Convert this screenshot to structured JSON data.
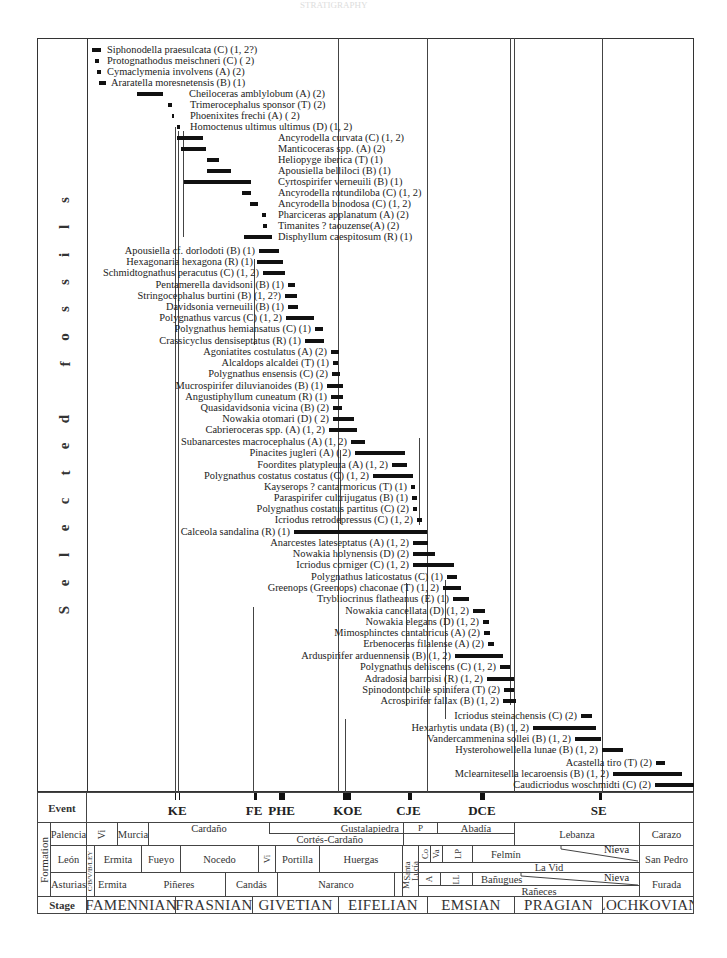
{
  "header": {
    "faint_title": "STRATIGRAPHY"
  },
  "vertical_title": [
    "S",
    "e",
    "l",
    "e",
    "c",
    "t",
    "e",
    "d",
    "",
    "f",
    "o",
    "s",
    "s",
    "i",
    "l",
    "s"
  ],
  "layout": {
    "stage_boundaries_px": {
      "start": 87,
      "FAMENNIAN_FRASNIAN": 175,
      "FRASNIAN_GIVETIAN": 252,
      "GIVETIAN_EIFELIAN": 338,
      "EIFELIAN_EMSIAN": 427,
      "EMSIAN_PRAGIAN": 514,
      "PRAGIAN_LOCHKOVIAN": 602,
      "end": 694
    }
  },
  "fossils": [
    {
      "name": "Siphonodella praesulcata (C) (1, 2?)",
      "y": 50,
      "x1": 92,
      "x2": 101,
      "label_x": 107,
      "align": "left"
    },
    {
      "name": "Protognathodus meischneri (C) ( 2)",
      "y": 61,
      "x1": 95,
      "x2": 99,
      "label_x": 107,
      "align": "left"
    },
    {
      "name": "Cymaclymenia involvens (A) (2)",
      "y": 72,
      "x1": 97,
      "x2": 101,
      "label_x": 107,
      "align": "left"
    },
    {
      "name": "Araratella moresnetensis (B) (1)",
      "y": 83,
      "x1": 99,
      "x2": 106,
      "label_x": 111,
      "align": "left"
    },
    {
      "name": "Cheiloceras amblylobum (A) (2)",
      "y": 94,
      "x1": 137,
      "x2": 163,
      "label_x": 189,
      "align": "left"
    },
    {
      "name": "Trimerocephalus sponsor (T) (2)",
      "y": 105,
      "x1": 168,
      "x2": 172,
      "label_x": 190,
      "align": "left"
    },
    {
      "name": "Phoenixites frechi (A) ( 2)",
      "y": 116,
      "x1": 172,
      "x2": 174,
      "label_x": 190,
      "align": "left"
    },
    {
      "name": "Homoctenus ultimus ultimus (D) (1, 2)",
      "y": 127,
      "x1": 177,
      "x2": 180,
      "label_x": 190,
      "align": "left"
    },
    {
      "name": "Ancyrodella curvata (C) (1, 2)",
      "y": 138,
      "x1": 177,
      "x2": 203,
      "label_x": 278,
      "align": "left"
    },
    {
      "name": "Manticoceras spp. (A) (2)",
      "y": 149,
      "x1": 181,
      "x2": 206,
      "label_x": 278,
      "align": "left"
    },
    {
      "name": "Heliopyge iberica (T) (1)",
      "y": 160,
      "x1": 207,
      "x2": 219,
      "label_x": 278,
      "align": "left"
    },
    {
      "name": "Apousiella belliloci (B) (1)",
      "y": 171,
      "x1": 207,
      "x2": 231,
      "label_x": 278,
      "align": "left"
    },
    {
      "name": "Cyrtospirifer verneuili (B) (1)",
      "y": 182,
      "x1": 184,
      "x2": 251,
      "label_x": 278,
      "align": "left"
    },
    {
      "name": "Ancyrodella rotundiloba (C) (1, 2)",
      "y": 193,
      "x1": 242,
      "x2": 251,
      "label_x": 278,
      "align": "left"
    },
    {
      "name": "Ancyrodella binodosa (C) (1, 2)",
      "y": 204,
      "x1": 250,
      "x2": 258,
      "label_x": 278,
      "align": "left"
    },
    {
      "name": "Pharciceras applanatum (A) (2)",
      "y": 215,
      "x1": 262,
      "x2": 266,
      "label_x": 278,
      "align": "left"
    },
    {
      "name": "Timanites ? taouzense(A) (2)",
      "y": 226,
      "x1": 263,
      "x2": 267,
      "label_x": 278,
      "align": "left"
    },
    {
      "name": "Disphyllum caespitosum (R) (1)",
      "y": 237,
      "x1": 244,
      "x2": 272,
      "label_x": 278,
      "align": "left"
    },
    {
      "name": "Apousiella cf. dorlodoti (B) (1)",
      "y": 251,
      "x1": 259,
      "x2": 279,
      "label_x": 253,
      "align": "right"
    },
    {
      "name": "Hexagonaria hexagona (R) (1)",
      "y": 262,
      "x1": 257,
      "x2": 283,
      "label_x": 253,
      "align": "right"
    },
    {
      "name": "Schmidtognathus peracutus (C) (1, 2)",
      "y": 273,
      "x1": 263,
      "x2": 285,
      "label_x": 253,
      "align": "right"
    },
    {
      "name": "Pentamerella davidsoni (B) (1)",
      "y": 285,
      "x1": 288,
      "x2": 295,
      "label_x": 253,
      "align": "right"
    },
    {
      "name": "Stringocephalus burtini (B) (1, 2?)",
      "y": 296,
      "x1": 285,
      "x2": 297,
      "label_x": 253,
      "align": "right"
    },
    {
      "name": "Davidsonia verneuili (B) (1)",
      "y": 307,
      "x1": 288,
      "x2": 298,
      "label_x": 253,
      "align": "right"
    },
    {
      "name": "Polygnathus varcus (C) (1, 2)",
      "y": 318,
      "x1": 286,
      "x2": 314,
      "label_x": 253,
      "align": "right"
    },
    {
      "name": "Polygnathus hemiansatus (C) (1)",
      "y": 329,
      "x1": 315,
      "x2": 323,
      "label_x": 253,
      "align": "right"
    },
    {
      "name": "Crassicyclus densiseptatus (R) (1)",
      "y": 341,
      "x1": 305,
      "x2": 324,
      "label_x": 253,
      "align": "right"
    },
    {
      "name": "Agoniatites costulatus (A) (2)",
      "y": 352,
      "x1": 331,
      "x2": 339,
      "label_x": 317,
      "align": "right"
    },
    {
      "name": "Alcaldops alcaldei (T) (1)",
      "y": 363,
      "x1": 333,
      "x2": 338,
      "label_x": 317,
      "align": "right"
    },
    {
      "name": "Polygnathus ensensis (C) (2)",
      "y": 374,
      "x1": 332,
      "x2": 340,
      "label_x": 317,
      "align": "right"
    },
    {
      "name": "Mucrospirifer diluvianoides (B) (1)",
      "y": 386,
      "x1": 327,
      "x2": 343,
      "label_x": 317,
      "align": "right"
    },
    {
      "name": "Angustiphyllum cuneatum (R) (1)",
      "y": 397,
      "x1": 331,
      "x2": 343,
      "label_x": 317,
      "align": "right"
    },
    {
      "name": "Quasidavidsonia vicina (B) (2)",
      "y": 408,
      "x1": 333,
      "x2": 342,
      "label_x": 317,
      "align": "right"
    },
    {
      "name": "Nowakia otomari (D) ( 2)",
      "y": 419,
      "x1": 333,
      "x2": 354,
      "label_x": 317,
      "align": "right"
    },
    {
      "name": "Cabrieroceras spp.  (A) (1, 2)",
      "y": 430,
      "x1": 329,
      "x2": 357,
      "label_x": 317,
      "align": "right"
    },
    {
      "name": "Subanarcestes macrocephalus (A) (1, 2)",
      "y": 442,
      "x1": 351,
      "x2": 365,
      "label_x": 317,
      "align": "right"
    },
    {
      "name": "Pinacites jugleri (A) ( 2)",
      "y": 453,
      "x1": 355,
      "x2": 405,
      "label_x": 317,
      "align": "right"
    },
    {
      "name": "Foordites platypleura (A) (1, 2)",
      "y": 465,
      "x1": 392,
      "x2": 407,
      "label_x": 317,
      "align": "right"
    },
    {
      "name": "Polygnathus costatus costatus (C) (1, 2)",
      "y": 476,
      "x1": 373,
      "x2": 413,
      "label_x": 317,
      "align": "right"
    },
    {
      "name": "Kayserops ? cantarmoricus (T) (1)",
      "y": 487,
      "x1": 411,
      "x2": 415,
      "label_x": 317,
      "align": "right"
    },
    {
      "name": "Paraspirifer cultrijugatus (B) (1)",
      "y": 498,
      "x1": 412,
      "x2": 417,
      "label_x": 317,
      "align": "right"
    },
    {
      "name": "Polygnathus costatus partitus (C) (2)",
      "y": 509,
      "x1": 413,
      "x2": 417,
      "label_x": 317,
      "align": "right"
    },
    {
      "name": "Icriodus retrodepressus (C) (1, 2)",
      "y": 520,
      "x1": 417,
      "x2": 422,
      "label_x": 317,
      "align": "right"
    },
    {
      "name": "Calceola sandalina (R) (1)",
      "y": 532,
      "x1": 294,
      "x2": 427,
      "label_x": 292,
      "align": "right"
    },
    {
      "name": "Anarcestes lateseptatus (A) (1, 2)",
      "y": 543,
      "x1": 413,
      "x2": 428,
      "label_x": 409,
      "align": "right"
    },
    {
      "name": "Nowakia holynensis (D) (2)",
      "y": 554,
      "x1": 413,
      "x2": 435,
      "label_x": 409,
      "align": "right"
    },
    {
      "name": "Icriodus corniger (C) (1, 2)",
      "y": 565,
      "x1": 413,
      "x2": 454,
      "label_x": 409,
      "align": "right"
    },
    {
      "name": "Polygnathus laticostatus (C) (1)",
      "y": 577,
      "x1": 447,
      "x2": 457,
      "label_x": 409,
      "align": "right"
    },
    {
      "name": "Greenops (Greenops) chaconae (T) (1, 2)",
      "y": 588,
      "x1": 443,
      "x2": 461,
      "label_x": 409,
      "align": "right"
    },
    {
      "name": "Trybliocrinus flatheanus (E) (1)",
      "y": 599,
      "x1": 453,
      "x2": 469,
      "label_x": 409,
      "align": "right"
    },
    {
      "name": "Nowakia cancellata (D) (1, 2)",
      "y": 611,
      "x1": 473,
      "x2": 485,
      "label_x": 409,
      "align": "right"
    },
    {
      "name": "Nowakia elegans (D) (1, 2)",
      "y": 622,
      "x1": 483,
      "x2": 489,
      "label_x": 409,
      "align": "right"
    },
    {
      "name": "Mimosphinctes cantabricus (A) (2)",
      "y": 633,
      "x1": 484,
      "x2": 490,
      "label_x": 409,
      "align": "right"
    },
    {
      "name": "Erbenoceras filalense (A) (2)",
      "y": 644,
      "x1": 488,
      "x2": 494,
      "label_x": 409,
      "align": "right"
    },
    {
      "name": "Arduspirifer arduennensis (B) (1, 2)",
      "y": 656,
      "x1": 455,
      "x2": 503,
      "label_x": 409,
      "align": "right"
    },
    {
      "name": "Polygnathus dehiscens (C) (1, 2)",
      "y": 667,
      "x1": 500,
      "x2": 510,
      "label_x": 409,
      "align": "right"
    },
    {
      "name": "Adradosia barroisi (R) (1, 2)",
      "y": 679,
      "x1": 487,
      "x2": 514,
      "label_x": 409,
      "align": "right"
    },
    {
      "name": "Spinodontochile spinifera (T) (2)",
      "y": 690,
      "x1": 504,
      "x2": 514,
      "label_x": 409,
      "align": "right"
    },
    {
      "name": "Acrospirifer fallax (B) (1, 2)",
      "y": 701,
      "x1": 503,
      "x2": 516,
      "label_x": 409,
      "align": "right"
    },
    {
      "name": "Icriodus steinachensis (C) (2)",
      "y": 716,
      "x1": 581,
      "x2": 592,
      "label_x": 524,
      "align": "right"
    },
    {
      "name": "Hexarhytis undata (B) (1, 2)",
      "y": 728,
      "x1": 533,
      "x2": 596,
      "label_x": 527,
      "align": "right"
    },
    {
      "name": "Vandercammenina sollei (B) (1, 2)",
      "y": 739,
      "x1": 575,
      "x2": 601,
      "label_x": 566,
      "align": "right"
    },
    {
      "name": "Hysterohowellella lunae (B) (1, 2)",
      "y": 750,
      "x1": 602,
      "x2": 623,
      "label_x": 566,
      "align": "right"
    },
    {
      "name": "Acastella tiro (T) (2)",
      "y": 763,
      "x1": 656,
      "x2": 665,
      "label_x": 566,
      "align": "right"
    },
    {
      "name": "Mclearnitesella lecaroensis (B) (1, 2)",
      "y": 774,
      "x1": 613,
      "x2": 682,
      "label_x": 566,
      "align": "right"
    },
    {
      "name": "Caudicriodus woschmidti (C) (2)",
      "y": 785,
      "x1": 655,
      "x2": 694,
      "label_x": 566,
      "align": "right"
    }
  ],
  "range_lines": [
    {
      "x": 175,
      "y1": 127,
      "y2": 792
    },
    {
      "x": 178,
      "y1": 131,
      "y2": 792
    },
    {
      "x": 183,
      "y1": 131,
      "y2": 237
    },
    {
      "x": 254,
      "y1": 259,
      "y2": 345
    },
    {
      "x": 253,
      "y1": 607,
      "y2": 792
    },
    {
      "x": 338,
      "y1": 38,
      "y2": 792
    },
    {
      "x": 340,
      "y1": 450,
      "y2": 524
    },
    {
      "x": 406,
      "y1": 583,
      "y2": 705
    },
    {
      "x": 419,
      "y1": 438,
      "y2": 525
    },
    {
      "x": 427,
      "y1": 38,
      "y2": 792
    },
    {
      "x": 514,
      "y1": 38,
      "y2": 792
    },
    {
      "x": 602,
      "y1": 38,
      "y2": 792
    },
    {
      "x": 345,
      "y1": 719,
      "y2": 792
    },
    {
      "x": 445,
      "y1": 580,
      "y2": 719
    },
    {
      "x": 510,
      "y1": 38,
      "y2": 705
    }
  ],
  "events": [
    {
      "label": "KE",
      "x": 177,
      "mark_w": 4,
      "double": true
    },
    {
      "label": "FE",
      "x": 255,
      "mark_w": 3,
      "double": false
    },
    {
      "label": "PHE",
      "x": 282,
      "mark_w": 6,
      "double": false
    },
    {
      "label": "KOE",
      "x": 347,
      "mark_w": 8,
      "double": false
    },
    {
      "label": "CJE",
      "x": 410,
      "mark_w": 4,
      "double": false
    },
    {
      "label": "DCE",
      "x": 482,
      "mark_w": 5,
      "double": false
    },
    {
      "label": "SE",
      "x": 600,
      "mark_w": 3,
      "double": false
    }
  ],
  "table": {
    "event_header": "Event",
    "formation_header": "Formation",
    "stage_header": "Stage",
    "rows": {
      "palencia": "Palencia",
      "leon": "León",
      "asturias": "Asturias"
    },
    "palencia_units": {
      "vi": "Vi",
      "murcia": "Murcia",
      "cardano": "Cardaño",
      "gustalapiedra": "Gustalapiedra",
      "cortes_cardano": "Cortés-Cardaño",
      "p": "P",
      "abadia": "Abadía",
      "lebanza": "Lebanza",
      "carazo": "Carazo"
    },
    "leon_units": {
      "cbvbley": "C/B/V/B/LEY",
      "ermita": "Ermita",
      "fueyo": "Fueyo",
      "nocedo": "Nocedo",
      "vi": "Vi",
      "portilla": "Portilla",
      "huergas": "Huergas",
      "santa_lucia": "Santa Lucía",
      "co": "Co",
      "va": "Va",
      "lp": "LP",
      "felmin": "Felmín",
      "nieva": "Nieva",
      "la_vid": "La Vid",
      "san_pedro": "San Pedro"
    },
    "asturias_units": {
      "ermita": "Ermita",
      "pineres": "Piñeres",
      "candas": "Candás",
      "naranco": "Naranco",
      "m": "M",
      "a": "A",
      "ll": "LL",
      "banugues": "Bañugues",
      "nieva": "Nieva",
      "raneces": "Rañeces",
      "furada": "Furada"
    },
    "stages": [
      "FAMENNIAN",
      "FRASNIAN",
      "GIVETIAN",
      "EIFELIAN",
      "EMSIAN",
      "PRAGIAN",
      "LOCHKOVIAN"
    ]
  }
}
